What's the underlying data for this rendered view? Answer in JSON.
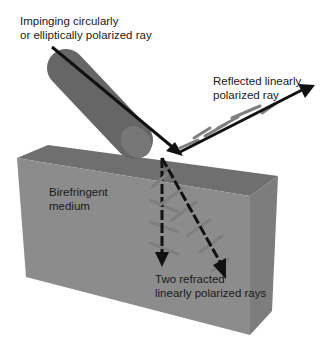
{
  "labels": {
    "incident": {
      "line1": "Impinging circularly",
      "line2": "or elliptically polarized ray"
    },
    "reflected": {
      "line1": "Reflected linearly",
      "line2": "polarized ray"
    },
    "medium": {
      "line1": "Birefringent",
      "line2": "medium"
    },
    "refracted": {
      "line1": "Two refracted",
      "line2": "linearly polarized rays"
    }
  },
  "colors": {
    "background": "#ffffff",
    "block_front": "#8a8a8a",
    "block_top": "#6e6e6e",
    "block_side": "#7a7a7a",
    "cylinder": "#6a6a6a",
    "ray": "#111111",
    "polarization_tick": "#7f7f7f"
  }
}
